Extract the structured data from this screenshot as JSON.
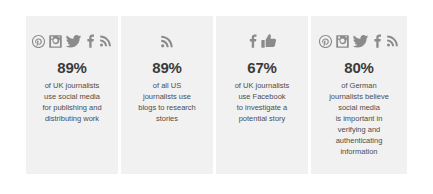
{
  "infographic": {
    "background_color": "#ffffff",
    "card_background_color": "#f1f1f1",
    "icon_color": "#8b8b8b",
    "stat_color": "#3b3b3b",
    "text_color": "#4d4d4d"
  },
  "cards": [
    {
      "id": "uk-journalists-social-media",
      "icons": [
        "pinterest-icon",
        "instagram-icon",
        "twitter-icon",
        "facebook-icon",
        "rss-icon"
      ],
      "stat": "89%",
      "lines": [
        "of UK journalists",
        "use social media",
        "for publishing and",
        "distributing work"
      ],
      "description": "of UK journalists use social media for publishing and distributing work"
    },
    {
      "id": "us-journalists-blogs",
      "icons": [
        "rss-icon"
      ],
      "stat": "89%",
      "lines": [
        "of all US",
        "journalists use",
        "blogs to research",
        "stories"
      ],
      "description": "of all US journalists use blogs to research stories"
    },
    {
      "id": "uk-journalists-facebook",
      "icons": [
        "facebook-icon",
        "thumbs-up-icon"
      ],
      "stat": "67%",
      "lines": [
        "of UK journalists",
        "use Facebook",
        "to investigate a",
        "potential story"
      ],
      "description": "of UK journalists use Facebook to investigate a potential story"
    },
    {
      "id": "german-journalists-verification",
      "icons": [
        "pinterest-icon",
        "instagram-icon",
        "twitter-icon",
        "facebook-icon",
        "rss-icon"
      ],
      "stat": "80%",
      "lines": [
        "of German",
        "journalists believe",
        "social media",
        "is important in",
        "verifying and",
        "authenticating",
        "information"
      ],
      "description": "of German journalists believe social media is important in verifying and authenticating information"
    }
  ]
}
